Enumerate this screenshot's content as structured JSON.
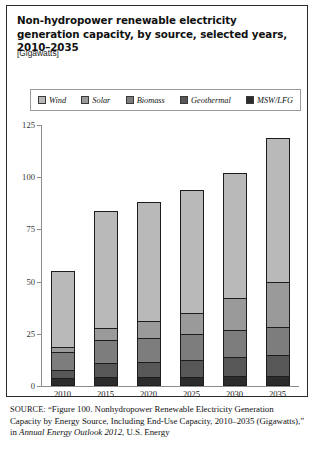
{
  "figure": {
    "title": "Non-hydropower renewable electricity generation capacity, by source, selected years, 2010–2035",
    "units": "[Gigawatts]"
  },
  "legend": {
    "items": [
      {
        "label": "Wind",
        "color": "#b9b9b9",
        "name": "wind"
      },
      {
        "label": "Solar",
        "color": "#9a9a9a",
        "name": "solar"
      },
      {
        "label": "Biomass",
        "color": "#7d7d7d",
        "name": "biomass"
      },
      {
        "label": "Geothermal",
        "color": "#575757",
        "name": "geothermal"
      },
      {
        "label": "MSW/LFG",
        "color": "#2c2c2c",
        "name": "msw-lfg"
      }
    ]
  },
  "source": {
    "label": "SOURCE:",
    "line1": "“Figure 100. Nonhydropower Renewable Electricity Generation Capacity by Energy Source, Including End-Use Capacity, 2010–2035 (Gigawatts),” in ",
    "italic1": "Annual Energy Outlook 2012",
    "line2": ", U.S. Energy"
  },
  "chart_data": {
    "type": "bar",
    "subtype": "stacked-vertical",
    "title": "Non-hydropower renewable electricity generation capacity, by source, selected years, 2010–2035",
    "xlabel": "",
    "ylabel": "Gigawatts",
    "ylim": [
      0,
      125
    ],
    "yticks": [
      0,
      25,
      50,
      75,
      100,
      125
    ],
    "ytick_labels": [
      "0",
      "25",
      "50",
      "75",
      "100",
      "125"
    ],
    "grid": false,
    "legend_position": "top",
    "categories": [
      "2010",
      "2015",
      "2020",
      "2025",
      "2030",
      "2035"
    ],
    "series": [
      {
        "name": "MSW/LFG",
        "color": "#2c2c2c",
        "values": [
          4.0,
          4.2,
          4.3,
          4.5,
          4.7,
          5.0
        ]
      },
      {
        "name": "Geothermal",
        "color": "#575757",
        "values": [
          3.5,
          6.8,
          7.2,
          8.0,
          9.0,
          10.0
        ]
      },
      {
        "name": "Biomass",
        "color": "#7d7d7d",
        "values": [
          9.0,
          11.0,
          11.5,
          12.5,
          13.3,
          13.5
        ]
      },
      {
        "name": "Solar",
        "color": "#9a9a9a",
        "values": [
          2.0,
          6.0,
          8.0,
          10.0,
          15.0,
          21.5
        ]
      },
      {
        "name": "Wind",
        "color": "#b9b9b9",
        "values": [
          36.5,
          56.0,
          57.0,
          59.0,
          60.0,
          69.0
        ]
      }
    ],
    "totals": [
      55,
      84,
      88,
      94,
      102,
      119
    ]
  }
}
